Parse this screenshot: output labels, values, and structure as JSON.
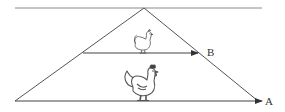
{
  "diagram": {
    "type": "perspective-triangle",
    "colors": {
      "line": "#555555",
      "horizon": "#888888",
      "label": "#333333"
    },
    "horizon_line": {
      "x1": 15,
      "y1": 8,
      "x2": 262,
      "y2": 8
    },
    "apex": {
      "x": 144,
      "y": 8
    },
    "left_base": {
      "x": 15,
      "y": 101
    },
    "right_base": {
      "x": 258,
      "y": 101
    },
    "arrows": [
      {
        "id": "B",
        "label": "B",
        "x1": 83,
        "y1": 53,
        "x2": 198,
        "y2": 53,
        "label_x": 208,
        "label_y": 47
      },
      {
        "id": "A",
        "label": "A",
        "x1": 15,
        "y1": 101,
        "x2": 262,
        "y2": 101,
        "label_x": 265,
        "label_y": 96
      }
    ],
    "figures": [
      {
        "name": "small-chicken",
        "description": "small chicken standing on line B",
        "x": 143,
        "base_y": 53,
        "height": 20
      },
      {
        "name": "large-rooster",
        "description": "large rooster standing on line A",
        "x": 143,
        "base_y": 101,
        "height": 34
      }
    ]
  },
  "labels": {
    "a": "A",
    "b": "B"
  }
}
